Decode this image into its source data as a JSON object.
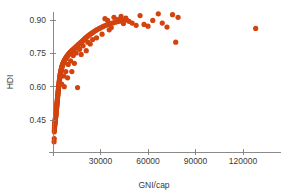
{
  "chart_data": {
    "type": "scatter",
    "title": "",
    "subtitle": "",
    "xlabel": "GNI/cap",
    "ylabel": "HDI",
    "xlim": [
      0,
      136000
    ],
    "ylim": [
      0.33,
      0.955
    ],
    "xticks": [
      30000,
      60000,
      90000,
      120000
    ],
    "xtick_labels": [
      "30000",
      "60000",
      "90000",
      "120000"
    ],
    "yticks": [
      0.45,
      0.6,
      0.75,
      0.9
    ],
    "ytick_labels": [
      "0.45",
      "0.60",
      "0.75",
      "0.90"
    ],
    "grid": false,
    "legend": false,
    "legend_position": "none",
    "marker_color": "#d2430f",
    "marker_size": 2.6,
    "axis_color": "#7d7d7d",
    "text_color": "#3a3a3a",
    "n_points": 193,
    "annotations": [],
    "series": [
      {
        "name": "Countries",
        "color": "#d2430f",
        "points": [
          [
            660,
            0.352
          ],
          [
            780,
            0.366
          ],
          [
            820,
            0.397
          ],
          [
            900,
            0.404
          ],
          [
            950,
            0.412
          ],
          [
            1010,
            0.419
          ],
          [
            1060,
            0.424
          ],
          [
            1100,
            0.428
          ],
          [
            1150,
            0.431
          ],
          [
            1190,
            0.434
          ],
          [
            1240,
            0.437
          ],
          [
            1280,
            0.44
          ],
          [
            1320,
            0.443
          ],
          [
            1360,
            0.446
          ],
          [
            1410,
            0.449
          ],
          [
            1450,
            0.451
          ],
          [
            1490,
            0.454
          ],
          [
            1530,
            0.456
          ],
          [
            1570,
            0.459
          ],
          [
            1610,
            0.461
          ],
          [
            1660,
            0.463
          ],
          [
            1700,
            0.466
          ],
          [
            1740,
            0.468
          ],
          [
            1780,
            0.471
          ],
          [
            1830,
            0.474
          ],
          [
            1870,
            0.477
          ],
          [
            1910,
            0.48
          ],
          [
            1960,
            0.483
          ],
          [
            2000,
            0.486
          ],
          [
            2050,
            0.489
          ],
          [
            2090,
            0.492
          ],
          [
            2140,
            0.495
          ],
          [
            2180,
            0.498
          ],
          [
            2230,
            0.502
          ],
          [
            2270,
            0.505
          ],
          [
            2320,
            0.508
          ],
          [
            2370,
            0.512
          ],
          [
            2410,
            0.515
          ],
          [
            2460,
            0.519
          ],
          [
            2510,
            0.522
          ],
          [
            2560,
            0.526
          ],
          [
            2610,
            0.53
          ],
          [
            2660,
            0.533
          ],
          [
            2710,
            0.537
          ],
          [
            2760,
            0.541
          ],
          [
            2810,
            0.545
          ],
          [
            2860,
            0.549
          ],
          [
            2910,
            0.553
          ],
          [
            2970,
            0.557
          ],
          [
            3020,
            0.561
          ],
          [
            3080,
            0.565
          ],
          [
            3130,
            0.569
          ],
          [
            3190,
            0.574
          ],
          [
            3250,
            0.578
          ],
          [
            3300,
            0.582
          ],
          [
            3360,
            0.586
          ],
          [
            3420,
            0.59
          ],
          [
            3480,
            0.594
          ],
          [
            3540,
            0.598
          ],
          [
            3610,
            0.602
          ],
          [
            3670,
            0.606
          ],
          [
            3730,
            0.61
          ],
          [
            3800,
            0.614
          ],
          [
            3870,
            0.618
          ],
          [
            3930,
            0.622
          ],
          [
            4000,
            0.626
          ],
          [
            4070,
            0.63
          ],
          [
            4140,
            0.634
          ],
          [
            4220,
            0.638
          ],
          [
            4290,
            0.642
          ],
          [
            4360,
            0.645
          ],
          [
            4440,
            0.649
          ],
          [
            4520,
            0.652
          ],
          [
            4600,
            0.656
          ],
          [
            4680,
            0.659
          ],
          [
            4760,
            0.662
          ],
          [
            4850,
            0.665
          ],
          [
            4930,
            0.668
          ],
          [
            5020,
            0.671
          ],
          [
            5110,
            0.674
          ],
          [
            5200,
            0.677
          ],
          [
            5300,
            0.68
          ],
          [
            5390,
            0.683
          ],
          [
            5490,
            0.686
          ],
          [
            5590,
            0.688
          ],
          [
            5700,
            0.691
          ],
          [
            5800,
            0.693
          ],
          [
            5910,
            0.696
          ],
          [
            6020,
            0.698
          ],
          [
            6140,
            0.7
          ],
          [
            6260,
            0.703
          ],
          [
            6380,
            0.705
          ],
          [
            6500,
            0.707
          ],
          [
            6630,
            0.709
          ],
          [
            6760,
            0.711
          ],
          [
            6900,
            0.713
          ],
          [
            7040,
            0.715
          ],
          [
            7180,
            0.717
          ],
          [
            7330,
            0.719
          ],
          [
            7480,
            0.721
          ],
          [
            7640,
            0.723
          ],
          [
            7800,
            0.725
          ],
          [
            7970,
            0.727
          ],
          [
            8140,
            0.729
          ],
          [
            8320,
            0.731
          ],
          [
            8500,
            0.733
          ],
          [
            8690,
            0.735
          ],
          [
            8880,
            0.737
          ],
          [
            9080,
            0.739
          ],
          [
            9290,
            0.741
          ],
          [
            9500,
            0.743
          ],
          [
            9720,
            0.745
          ],
          [
            9950,
            0.747
          ],
          [
            10180,
            0.749
          ],
          [
            10420,
            0.751
          ],
          [
            10670,
            0.753
          ],
          [
            10930,
            0.755
          ],
          [
            11200,
            0.757
          ],
          [
            11480,
            0.759
          ],
          [
            11770,
            0.761
          ],
          [
            12070,
            0.763
          ],
          [
            12380,
            0.765
          ],
          [
            12700,
            0.767
          ],
          [
            13030,
            0.769
          ],
          [
            13370,
            0.771
          ],
          [
            13730,
            0.774
          ],
          [
            14100,
            0.776
          ],
          [
            14480,
            0.779
          ],
          [
            14880,
            0.781
          ],
          [
            15290,
            0.784
          ],
          [
            15720,
            0.787
          ],
          [
            16160,
            0.79
          ],
          [
            16620,
            0.793
          ],
          [
            17100,
            0.796
          ],
          [
            17600,
            0.799
          ],
          [
            18120,
            0.803
          ],
          [
            18660,
            0.806
          ],
          [
            19220,
            0.81
          ],
          [
            19800,
            0.814
          ],
          [
            20410,
            0.818
          ],
          [
            21050,
            0.822
          ],
          [
            21710,
            0.826
          ],
          [
            22400,
            0.83
          ],
          [
            23120,
            0.834
          ],
          [
            23880,
            0.838
          ],
          [
            24670,
            0.842
          ],
          [
            25500,
            0.846
          ],
          [
            26370,
            0.85
          ],
          [
            27280,
            0.854
          ],
          [
            28240,
            0.858
          ],
          [
            29240,
            0.862
          ],
          [
            30300,
            0.866
          ],
          [
            31400,
            0.87
          ],
          [
            32560,
            0.874
          ],
          [
            33780,
            0.877
          ],
          [
            35070,
            0.881
          ],
          [
            36430,
            0.884
          ],
          [
            37860,
            0.887
          ],
          [
            39380,
            0.89
          ],
          [
            40990,
            0.893
          ],
          [
            42700,
            0.895
          ],
          [
            44520,
            0.898
          ],
          [
            46450,
            0.9
          ],
          [
            5500,
            0.612
          ],
          [
            6800,
            0.648
          ],
          [
            8100,
            0.668
          ],
          [
            9600,
            0.7
          ],
          [
            11100,
            0.716
          ],
          [
            12800,
            0.74
          ],
          [
            14600,
            0.752
          ],
          [
            16800,
            0.768
          ],
          [
            19000,
            0.784
          ],
          [
            22000,
            0.8
          ],
          [
            25000,
            0.812
          ],
          [
            13500,
            0.705
          ],
          [
            17800,
            0.745
          ],
          [
            21000,
            0.762
          ],
          [
            9200,
            0.64
          ],
          [
            7100,
            0.6
          ],
          [
            15500,
            0.596
          ],
          [
            11900,
            0.668
          ],
          [
            23500,
            0.792
          ],
          [
            27500,
            0.82
          ],
          [
            31000,
            0.836
          ],
          [
            35500,
            0.856
          ],
          [
            32800,
            0.906
          ],
          [
            34500,
            0.898
          ],
          [
            36800,
            0.866
          ],
          [
            38500,
            0.912
          ],
          [
            41000,
            0.902
          ],
          [
            43000,
            0.916
          ],
          [
            44500,
            0.884
          ],
          [
            46000,
            0.908
          ],
          [
            48000,
            0.894
          ],
          [
            50000,
            0.886
          ],
          [
            52500,
            0.876
          ],
          [
            55000,
            0.92
          ],
          [
            57500,
            0.88
          ],
          [
            60000,
            0.872
          ],
          [
            63000,
            0.898
          ],
          [
            66500,
            0.928
          ],
          [
            69000,
            0.886
          ],
          [
            72000,
            0.868
          ],
          [
            75500,
            0.924
          ],
          [
            77500,
            0.8
          ],
          [
            79000,
            0.912
          ],
          [
            128000,
            0.862
          ]
        ]
      }
    ]
  },
  "axes": {
    "x_title": "GNI/cap",
    "y_title": "HDI"
  }
}
